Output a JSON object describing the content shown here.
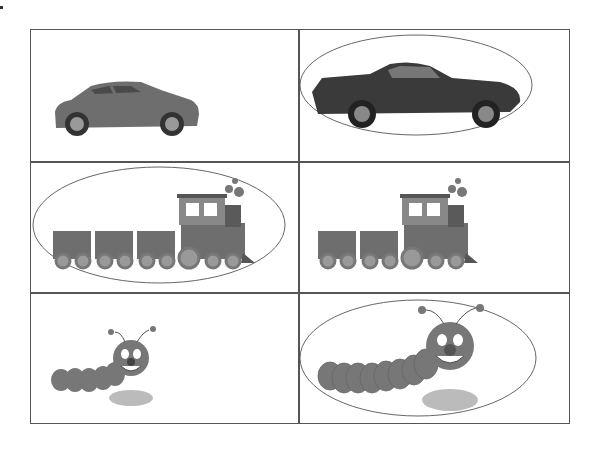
{
  "worksheet": {
    "rows": [
      {
        "left": {
          "item": "hatchback car",
          "circled": false
        },
        "right": {
          "item": "classic muscle car",
          "circled": true
        }
      },
      {
        "left": {
          "item": "train with three cars",
          "circled": true
        },
        "right": {
          "item": "train with two cars",
          "circled": false
        }
      },
      {
        "left": {
          "item": "small caterpillar",
          "circled": false
        },
        "right": {
          "item": "large caterpillar",
          "circled": true
        }
      }
    ]
  },
  "colors": {
    "line": "#555555",
    "object": "#6e6e6e",
    "dark": "#3a3a3a"
  }
}
